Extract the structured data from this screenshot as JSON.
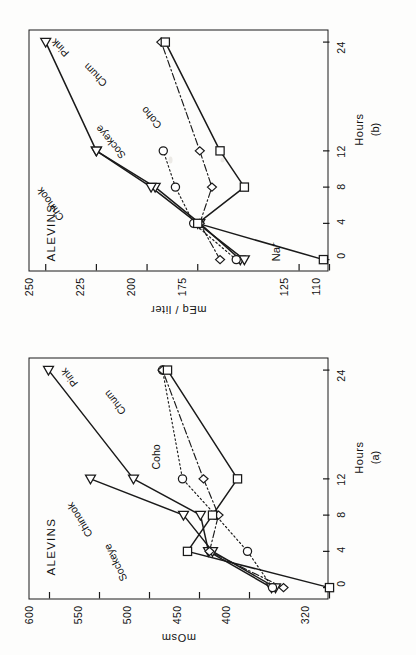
{
  "figure": {
    "group_label": "ALEVINS",
    "x_axis_title": "Hours",
    "x_ticks": [
      0,
      4,
      8,
      12,
      24
    ],
    "x_tick_labels": [
      "0",
      "4",
      "8",
      "12",
      "24"
    ],
    "series_names": [
      "Chinook",
      "Sockeye",
      "Coho",
      "Chum",
      "Pink"
    ],
    "line_color": "#1a1a1a",
    "background": "#fdfdfc"
  },
  "chart_data": [
    {
      "type": "line",
      "panel": "(a)",
      "title": "",
      "ylabel": "mOsm",
      "xlabel": "Hours",
      "x": [
        0,
        4,
        8,
        12,
        24
      ],
      "xlim": [
        -1.2,
        25.5
      ],
      "ylim": [
        320,
        620
      ],
      "yticks": [
        320,
        400,
        450,
        500,
        550,
        600
      ],
      "ytick_labels": [
        "320",
        "400",
        "450",
        "500",
        "550",
        "600"
      ],
      "grid": false,
      "legend": "inline-labels",
      "series": [
        {
          "name": "Chinook",
          "marker": "triangle-left",
          "linestyle": "solid",
          "x": [
            0,
            4,
            8,
            12,
            24
          ],
          "values": [
            378,
            441,
            449,
            516,
            601
          ]
        },
        {
          "name": "Sockeye",
          "marker": "triangle-left",
          "linestyle": "solid",
          "x": [
            0,
            4,
            8,
            12
          ],
          "values": [
            374,
            437,
            466,
            559
          ]
        },
        {
          "name": "Coho",
          "marker": "circle",
          "linestyle": "dotted",
          "x": [
            0,
            4,
            8,
            12,
            24
          ],
          "values": [
            377,
            402,
            434,
            467,
            487
          ]
        },
        {
          "name": "Chum",
          "marker": "diamond",
          "linestyle": "dashdot",
          "x": [
            0,
            4,
            8,
            12,
            24
          ],
          "values": [
            366,
            440,
            431,
            446,
            487
          ]
        },
        {
          "name": "Pink",
          "marker": "square",
          "linestyle": "solid",
          "x": [
            0,
            4,
            8,
            12,
            24
          ],
          "values": [
            320,
            462,
            437,
            412,
            482
          ]
        }
      ],
      "inline_labels": [
        "Chinook",
        "Sockeye",
        "Coho",
        "Chum",
        "Pink"
      ]
    },
    {
      "type": "line",
      "panel": "(b)",
      "title": "",
      "ion": "Na+",
      "ylabel": "mEq / liter",
      "xlabel": "Hours",
      "x": [
        0,
        4,
        8,
        12,
        24
      ],
      "xlim": [
        -1.2,
        25.5
      ],
      "ylim": [
        110,
        258
      ],
      "yticks": [
        110,
        125,
        175,
        200,
        225,
        250
      ],
      "ytick_labels": [
        "110",
        "125",
        "175",
        "200",
        "225",
        "250"
      ],
      "grid": false,
      "legend": "inline-labels",
      "series": [
        {
          "name": "Chinook",
          "marker": "triangle-left",
          "linestyle": "solid",
          "x": [
            0,
            4,
            8,
            12,
            24
          ],
          "values": [
            154,
            174,
            196,
            225,
            250
          ]
        },
        {
          "name": "Sockeye",
          "marker": "triangle-left",
          "linestyle": "solid",
          "x": [
            0,
            4,
            8,
            12
          ],
          "values": [
            152,
            175,
            198,
            225
          ]
        },
        {
          "name": "Coho",
          "marker": "circle",
          "linestyle": "dotted",
          "x": [
            0,
            4,
            8,
            12
          ],
          "values": [
            156,
            177,
            186,
            192
          ]
        },
        {
          "name": "Chum",
          "marker": "diamond",
          "linestyle": "dashdot",
          "x": [
            0,
            4,
            8,
            12,
            24
          ],
          "values": [
            164,
            174,
            168,
            174,
            193
          ]
        },
        {
          "name": "Pink",
          "marker": "square",
          "linestyle": "solid",
          "x": [
            0,
            4,
            8,
            12,
            24
          ],
          "values": [
            113,
            175,
            152,
            164,
            191
          ]
        }
      ],
      "inline_labels": [
        "Chinook",
        "Sockeye",
        "Coho",
        "Chum",
        "Pink"
      ]
    }
  ],
  "panel_a": {
    "letter": "(a)",
    "ylabel": "mOsm",
    "xlabel": "Hours",
    "group_label": "ALEVINS",
    "labels": {
      "chinook": "Chinook",
      "sockeye": "Sockeye",
      "coho": "Coho",
      "chum": "Chum",
      "pink": "Pink"
    },
    "yticks": [
      "600",
      "550",
      "500",
      "450",
      "400",
      "320"
    ],
    "xticks": [
      "0",
      "4",
      "8",
      "12",
      "24"
    ]
  },
  "panel_b": {
    "letter": "(b)",
    "ion_label": "Na",
    "ion_superscript": "+",
    "ylabel": "mEq / liter",
    "xlabel": "Hours",
    "group_label": "ALEVINS",
    "labels": {
      "chinook": "Chinook",
      "sockeye": "Sockeye",
      "coho": "Coho",
      "chum": "Chum",
      "pink": "Pink"
    },
    "yticks": [
      "250",
      "225",
      "200",
      "175",
      "125",
      "110"
    ],
    "xticks": [
      "0",
      "4",
      "8",
      "12",
      "24"
    ]
  }
}
